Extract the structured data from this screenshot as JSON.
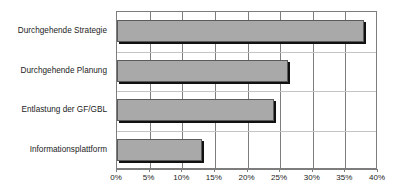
{
  "chart_data": {
    "type": "bar",
    "orientation": "horizontal",
    "title": "",
    "xlabel": "",
    "ylabel": "",
    "categories": [
      "Durchgehende Strategie",
      "Durchgehende Planung",
      "Entlastung der GF/GBL",
      "Informationsplattform"
    ],
    "values": [
      37.8,
      26.2,
      24.0,
      13.0
    ],
    "value_unit": "%",
    "xlim": [
      0,
      40
    ],
    "xticks": [
      0,
      5,
      10,
      15,
      20,
      25,
      30,
      35,
      40
    ],
    "xtick_labels": [
      "0%",
      "5%",
      "10%",
      "15%",
      "20%",
      "25%",
      "30%",
      "35%",
      "40%"
    ],
    "grid": "vertical-and-horizontal",
    "legend": "none",
    "series": [
      {
        "name": "Anteil",
        "values": [
          37.8,
          26.2,
          24.0,
          13.0
        ]
      }
    ],
    "colors": {
      "bar_fill": "#a9a9a9",
      "bar_border": "#5a5a5a",
      "bar_shadow": "#111111",
      "grid_major": "#7d7d7d",
      "grid_minor": "#c4c4c4",
      "plot_background": "#ffffff",
      "text": "#1c1c1c"
    }
  }
}
